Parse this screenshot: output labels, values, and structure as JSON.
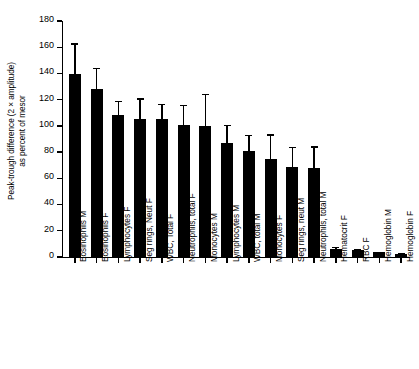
{
  "chart_data": {
    "type": "bar",
    "title": "",
    "xlabel": "",
    "ylabel": "Peak-trough difference (2 × amplitude) as percent of mesor",
    "ylabel_lines": [
      "Peak-trough difference (2 × amplitude)",
      "as percent of mesor"
    ],
    "ylim": [
      0,
      180
    ],
    "yticks": [
      0,
      20,
      40,
      60,
      80,
      100,
      120,
      140,
      160,
      180
    ],
    "ytick_labels": [
      "0",
      "20",
      "40",
      "60",
      "80",
      "100",
      "120",
      "140",
      "160",
      "180"
    ],
    "grid": false,
    "legend": false,
    "bar_color": "#000000",
    "error_color": "#000000",
    "error_bars": "upper only (SEM/SD whisker)",
    "categories": [
      "Eosinophils M",
      "Eosinophils F",
      "Lymphocytes F",
      "Seg rings, Neut F",
      "WBC, Total F",
      "Neutrophils, total F",
      "Monocytes M",
      "Lymphocytes M",
      "WBC, total M",
      "Monocytes F",
      "Seg rings, neut M",
      "Neutrophils, total M",
      "Hematocrit F",
      "RBC F",
      "Hemoglobin M",
      "Hemoglobin F"
    ],
    "values": [
      139.5,
      128.5,
      108.5,
      105,
      105,
      101,
      100,
      87,
      81,
      75,
      69,
      68,
      6,
      5,
      3.5,
      2.5
    ],
    "error_upper": [
      163,
      144,
      119,
      121,
      117,
      116,
      124.5,
      101,
      93,
      93.5,
      84,
      84.5,
      7.5,
      5.8,
      4,
      3
    ]
  }
}
